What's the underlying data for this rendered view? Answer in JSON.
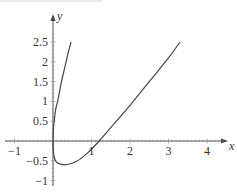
{
  "chart_data": {
    "type": "line",
    "title": "",
    "xlabel": "x",
    "ylabel": "y",
    "xlim": [
      -1.3,
      4.5
    ],
    "ylim": [
      -1.1,
      2.9
    ],
    "grid": false,
    "legend": null,
    "x_ticks": [
      -1,
      1,
      2,
      3,
      4
    ],
    "x_tick_labels": [
      "−1",
      "1",
      "2",
      "3",
      "4"
    ],
    "y_ticks": [
      2.5,
      2,
      1.5,
      1,
      0.5,
      -0.5,
      -1
    ],
    "y_tick_labels": [
      "2.5",
      "2",
      "1.5",
      "1",
      "0.5",
      "−0.5",
      "−1"
    ],
    "series": [
      {
        "name": "upper branch",
        "color": "#444444",
        "points": [
          [
            0,
            0
          ],
          [
            0.01,
            0.3
          ],
          [
            0.03,
            0.5
          ],
          [
            0.07,
            0.8
          ],
          [
            0.12,
            1.0
          ],
          [
            0.17,
            1.25
          ],
          [
            0.22,
            1.5
          ],
          [
            0.28,
            1.75
          ],
          [
            0.34,
            2.0
          ],
          [
            0.4,
            2.25
          ],
          [
            0.47,
            2.5
          ]
        ]
      },
      {
        "name": "lower branch",
        "color": "#444444",
        "points": [
          [
            0,
            0
          ],
          [
            0.005,
            -0.2
          ],
          [
            0.03,
            -0.4
          ],
          [
            0.08,
            -0.52
          ],
          [
            0.18,
            -0.58
          ],
          [
            0.34,
            -0.6
          ],
          [
            0.6,
            -0.52
          ],
          [
            0.9,
            -0.3
          ],
          [
            1.2,
            0
          ],
          [
            1.6,
            0.45
          ],
          [
            2.0,
            0.9
          ],
          [
            2.5,
            1.5
          ],
          [
            3.0,
            2.1
          ],
          [
            3.3,
            2.5
          ]
        ]
      }
    ]
  }
}
